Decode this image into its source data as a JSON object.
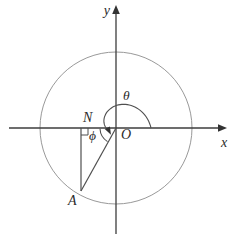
{
  "figure": {
    "type": "geometry-diagram",
    "labels": {
      "x_axis": "x",
      "y_axis": "y",
      "origin": "O",
      "point_a": "A",
      "point_n": "N",
      "theta": "θ",
      "phi": "ϕ"
    },
    "colors": {
      "background": "#ffffff",
      "axis": "#3d3d3d",
      "circle": "#999999",
      "lines": "#4f4f4f",
      "arrow_fill": "#333333",
      "text": "#2b2b2b"
    }
  }
}
